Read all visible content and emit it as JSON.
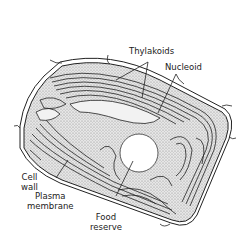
{
  "diagram": {
    "type": "cell-illustration",
    "labels": {
      "thylakoids": "Thylakoids",
      "nucleoid": "Nucleoid",
      "cell_wall_line1": "Cell",
      "cell_wall_line2": "wall",
      "plasma_membrane_line1": "Plasma",
      "plasma_membrane_line2": "membrane",
      "food_reserve_line1": "Food",
      "food_reserve_line2": "reserve"
    },
    "colors": {
      "line": "#222222",
      "stipple": "#bdbdbd",
      "background": "#ffffff"
    }
  }
}
